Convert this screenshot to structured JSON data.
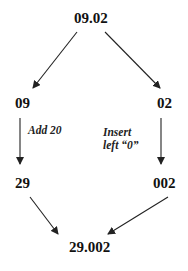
{
  "diagram": {
    "colors": {
      "text": "#111111",
      "arrow": "#222222",
      "background": "#ffffff"
    },
    "nodes": {
      "root": "09.02",
      "left_mid": "09",
      "right_mid": "02",
      "left_bottom": "29",
      "right_bottom": "002",
      "result": "29.002"
    },
    "edge_labels": {
      "left": "Add 20",
      "right_line1": "Insert",
      "right_line2": "left “0”"
    },
    "edges": [
      {
        "from": "09.02",
        "to": "09"
      },
      {
        "from": "09.02",
        "to": "02"
      },
      {
        "from": "09",
        "to": "29",
        "label": "Add 20"
      },
      {
        "from": "02",
        "to": "002",
        "label": "Insert left “0”"
      },
      {
        "from": "29",
        "to": "29.002"
      },
      {
        "from": "002",
        "to": "29.002"
      }
    ]
  }
}
